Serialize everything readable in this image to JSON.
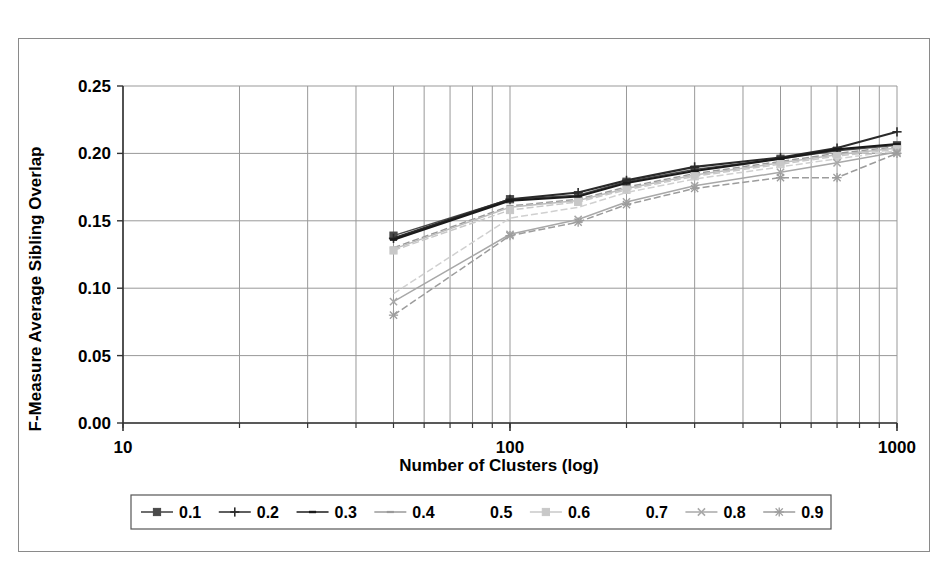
{
  "chart_data": {
    "type": "line",
    "title": "",
    "xlabel": "Number of Clusters (log)",
    "ylabel": "F-Measure Average Sibling Overlap",
    "xscale": "log",
    "xlim": [
      10,
      1000
    ],
    "ylim": [
      0.0,
      0.25
    ],
    "ytick_labels": [
      "0.25",
      "0.20",
      "0.15",
      "0.10",
      "0.05",
      "0.00"
    ],
    "ytick_values": [
      0.25,
      0.2,
      0.15,
      0.1,
      0.05,
      0.0
    ],
    "xtick_labels": [
      "10",
      "100",
      "1000"
    ],
    "xtick_values": [
      10,
      100,
      1000
    ],
    "grid": true,
    "legend_position": "bottom",
    "x": [
      50,
      100,
      150,
      200,
      300,
      500,
      700,
      1000
    ],
    "series": [
      {
        "name": "0.1",
        "marker": "square",
        "color": "#4a4a4a",
        "values": [
          0.139,
          0.166,
          0.169,
          0.179,
          0.188,
          0.196,
          0.202,
          0.206
        ]
      },
      {
        "name": "0.2",
        "marker": "plus",
        "color": "#2a2a2a",
        "values": [
          0.137,
          0.166,
          0.171,
          0.18,
          0.19,
          0.197,
          0.204,
          0.216
        ]
      },
      {
        "name": "0.3",
        "marker": "line",
        "color": "#1a1a1a",
        "values": [
          0.136,
          0.165,
          0.168,
          0.178,
          0.187,
          0.196,
          0.203,
          0.207
        ]
      },
      {
        "name": "0.4",
        "marker": "dash",
        "color": "#9a9a9a",
        "values": [
          0.13,
          0.161,
          0.166,
          0.175,
          0.185,
          0.194,
          0.2,
          0.205
        ]
      },
      {
        "name": "0.5",
        "marker": "none",
        "color": "#bdbdbd",
        "values": [
          0.129,
          0.16,
          0.165,
          0.174,
          0.184,
          0.193,
          0.199,
          0.204
        ]
      },
      {
        "name": "0.6",
        "marker": "faint-square",
        "color": "#c8c8c8",
        "values": [
          0.128,
          0.158,
          0.164,
          0.173,
          0.183,
          0.192,
          0.198,
          0.203
        ]
      },
      {
        "name": "0.7",
        "marker": "none",
        "color": "#d0d0d0",
        "values": [
          0.096,
          0.152,
          0.16,
          0.171,
          0.181,
          0.19,
          0.196,
          0.202
        ]
      },
      {
        "name": "0.8",
        "marker": "x",
        "color": "#a8a8a8",
        "values": [
          0.09,
          0.14,
          0.151,
          0.164,
          0.176,
          0.186,
          0.193,
          0.201
        ]
      },
      {
        "name": "0.9",
        "marker": "star",
        "color": "#9c9c9c",
        "values": [
          0.08,
          0.139,
          0.149,
          0.162,
          0.174,
          0.182,
          0.182,
          0.2
        ]
      }
    ]
  },
  "axes": {
    "ylabel": "F-Measure Average Sibling Overlap",
    "xlabel": "Number of Clusters (log)"
  },
  "legend": {
    "items": [
      {
        "label": "0.1"
      },
      {
        "label": "0.2"
      },
      {
        "label": "0.3"
      },
      {
        "label": "0.4"
      },
      {
        "label": "0.5"
      },
      {
        "label": "0.6"
      },
      {
        "label": "0.7"
      },
      {
        "label": "0.8"
      },
      {
        "label": "0.9"
      }
    ]
  },
  "style": {
    "frame_color": "#8a8a8a",
    "grid_color": "#999999",
    "axis_color": "#333333",
    "text_color": "#000000"
  }
}
